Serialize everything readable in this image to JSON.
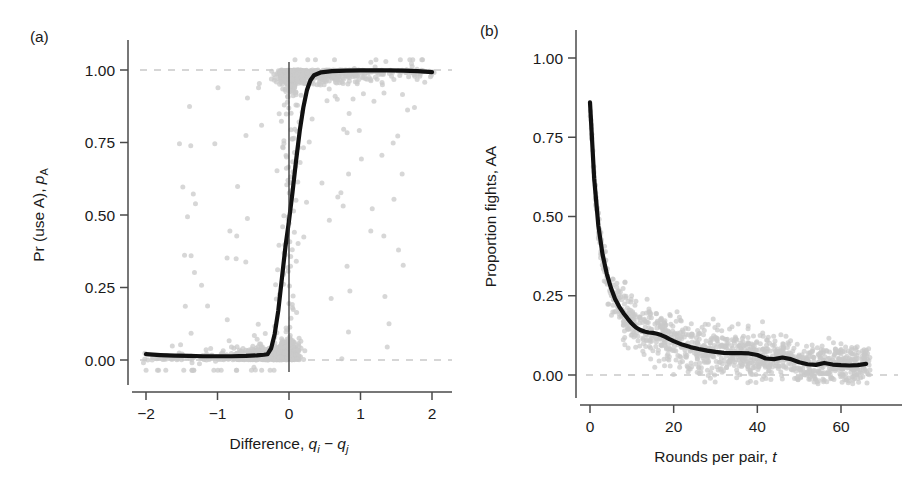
{
  "figure": {
    "background": "#ffffff",
    "width": 924,
    "height": 478,
    "point_color": "#c9c9c9",
    "curve_color": "#111111",
    "axis_color": "#4a4a4a",
    "reference_line_color": "#c9c9c9"
  },
  "panel_a": {
    "label": "(a)",
    "xlabel_plain": "Difference, ",
    "xlabel_sym_1": "q",
    "xlabel_sub_1": "i",
    "xlabel_minus": " − ",
    "xlabel_sym_2": "q",
    "xlabel_sub_2": "j",
    "ylabel_plain": "Pr (use A), ",
    "ylabel_sym": "p",
    "ylabel_sub": "A",
    "x_ticks": [
      "−2",
      "−1",
      "0",
      "1",
      "2"
    ],
    "x_tick_values": [
      -2,
      -1,
      0,
      1,
      2
    ],
    "y_ticks": [
      "1.00",
      "0.75",
      "0.50",
      "0.25",
      "0.00"
    ],
    "y_tick_values": [
      1.0,
      0.75,
      0.5,
      0.25,
      0.0
    ],
    "xlim": [
      -2.1,
      2.1
    ],
    "ylim": [
      -0.05,
      1.06
    ],
    "vertical_rule_x": 0,
    "reference_lines_y": [
      0.0,
      1.0
    ]
  },
  "panel_b": {
    "label": "(b)",
    "xlabel_plain": "Rounds per pair, ",
    "xlabel_sym": "t",
    "ylabel": "Proportion fights, AA",
    "x_ticks": [
      "0",
      "20",
      "40",
      "60"
    ],
    "x_tick_values": [
      0,
      20,
      40,
      60
    ],
    "y_ticks": [
      "1.00",
      "0.75",
      "0.50",
      "0.25",
      "0.00"
    ],
    "y_tick_values": [
      1.0,
      0.75,
      0.5,
      0.25,
      0.0
    ],
    "xlim": [
      -2,
      70
    ],
    "ylim": [
      -0.05,
      1.06
    ],
    "reference_lines_y": [
      0.0
    ]
  },
  "chart_data": [
    {
      "type": "scatter",
      "panel": "a",
      "title": "(a)",
      "xlabel": "Difference, q_i − q_j",
      "ylabel": "Pr (use A), p_A",
      "xlim": [
        -2.1,
        2.1
      ],
      "ylim": [
        -0.05,
        1.06
      ],
      "xticks": [
        -2,
        -1,
        0,
        1,
        2
      ],
      "yticks": [
        0.0,
        0.25,
        0.5,
        0.75,
        1.0
      ],
      "grid": false,
      "legend": "none",
      "annotations": [
        "vertical line at x = 0",
        "dashed reference lines at y = 0 and y = 1"
      ],
      "series": [
        {
          "name": "fitted logistic curve",
          "kind": "line",
          "color": "#111111",
          "x": [
            -2.0,
            -1.8,
            -1.6,
            -1.4,
            -1.2,
            -1.0,
            -0.8,
            -0.6,
            -0.45,
            -0.35,
            -0.3,
            -0.25,
            -0.2,
            -0.15,
            -0.1,
            -0.05,
            0.0,
            0.05,
            0.1,
            0.15,
            0.2,
            0.25,
            0.3,
            0.35,
            0.45,
            0.6,
            0.8,
            1.0,
            1.2,
            1.4,
            1.6,
            1.8,
            2.0
          ],
          "y": [
            0.02,
            0.017,
            0.015,
            0.014,
            0.013,
            0.013,
            0.013,
            0.014,
            0.016,
            0.018,
            0.02,
            0.04,
            0.09,
            0.17,
            0.28,
            0.39,
            0.48,
            0.58,
            0.69,
            0.79,
            0.87,
            0.93,
            0.965,
            0.982,
            0.992,
            0.996,
            0.998,
            0.999,
            0.999,
            0.999,
            0.998,
            0.996,
            0.993
          ]
        },
        {
          "name": "observed points",
          "kind": "points",
          "color": "#c9c9c9",
          "description": "dense cloud of grey points; heavy mass at y≈1 for x>0 and at y≈0 for x<0, with a narrow dense vertical band near x=0 spanning the full 0–1 range, plus scattered outliers"
        }
      ]
    },
    {
      "type": "scatter",
      "panel": "b",
      "title": "(b)",
      "xlabel": "Rounds per pair, t",
      "ylabel": "Proportion fights, AA",
      "xlim": [
        -2,
        70
      ],
      "ylim": [
        -0.05,
        1.06
      ],
      "xticks": [
        0,
        20,
        40,
        60
      ],
      "yticks": [
        0.0,
        0.25,
        0.5,
        0.75,
        1.0
      ],
      "grid": false,
      "legend": "none",
      "annotations": [
        "dashed reference line at y = 0"
      ],
      "series": [
        {
          "name": "mean proportion of fights",
          "kind": "line",
          "color": "#111111",
          "x": [
            0,
            1,
            2,
            3,
            4,
            5,
            6,
            7,
            8,
            9,
            10,
            11,
            12,
            13,
            14,
            15,
            16,
            17,
            18,
            19,
            20,
            22,
            24,
            26,
            28,
            30,
            32,
            34,
            36,
            38,
            40,
            42,
            44,
            46,
            48,
            50,
            52,
            54,
            56,
            58,
            60,
            62,
            64,
            66
          ],
          "y": [
            0.86,
            0.62,
            0.47,
            0.38,
            0.32,
            0.275,
            0.24,
            0.215,
            0.195,
            0.178,
            0.162,
            0.15,
            0.142,
            0.137,
            0.134,
            0.133,
            0.13,
            0.126,
            0.12,
            0.113,
            0.107,
            0.096,
            0.088,
            0.082,
            0.077,
            0.073,
            0.07,
            0.069,
            0.069,
            0.068,
            0.063,
            0.052,
            0.05,
            0.055,
            0.05,
            0.04,
            0.034,
            0.032,
            0.038,
            0.033,
            0.031,
            0.03,
            0.031,
            0.035
          ]
        },
        {
          "name": "observed points",
          "kind": "points",
          "color": "#c9c9c9",
          "description": "grey points scattered tightly about the decaying mean curve, spread widening slightly between t≈10 and t≈40"
        }
      ]
    }
  ]
}
